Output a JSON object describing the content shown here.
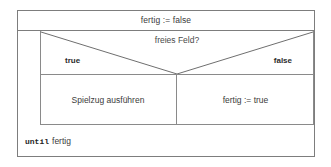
{
  "diagram": {
    "type": "nassi-shneiderman-struktogramm",
    "colors": {
      "background": "#ffffff",
      "border": "#7d7d7d",
      "inner_border": "#8a8a8a",
      "text": "#3b3b3b",
      "label_text": "#2b2b2b"
    },
    "init_statement": "fertig := false",
    "decision": {
      "condition": "freies Feld?",
      "true_label": "true",
      "false_label": "false",
      "true_branch": "Spielzug ausführen",
      "false_branch": "fertig := true"
    },
    "loop_footer": {
      "keyword": "until",
      "condition": "fertig"
    }
  }
}
